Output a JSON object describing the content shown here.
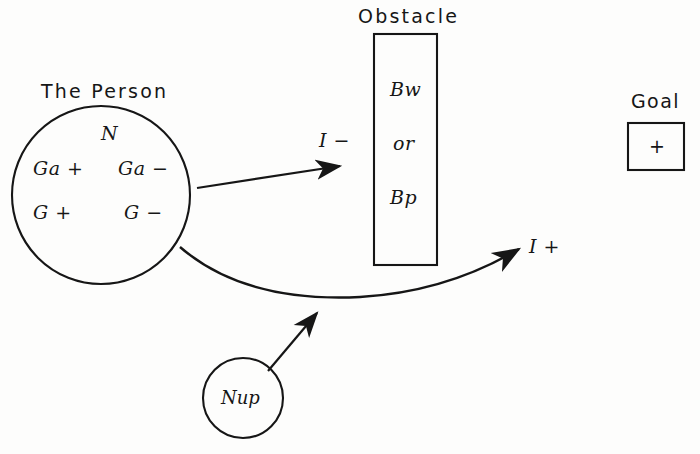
{
  "figure": {
    "background_color": "#fdfdfc",
    "ink_color": "#161616",
    "person": {
      "caption": "The Person",
      "center_label": "N",
      "quadrant_labels": {
        "upper_left": "Ga +",
        "upper_right": "Ga −",
        "lower_left": "G +",
        "lower_right": "G −"
      }
    },
    "obstacle": {
      "caption": "Obstacle",
      "contents": [
        "Bw",
        "or",
        "Bp"
      ]
    },
    "goal": {
      "caption": "Goal",
      "symbol": "+"
    },
    "need": {
      "label": "Nup"
    },
    "vectors": [
      {
        "name": "blocked-path",
        "label": "I −"
      },
      {
        "name": "goal-path",
        "label": "I +"
      }
    ]
  }
}
